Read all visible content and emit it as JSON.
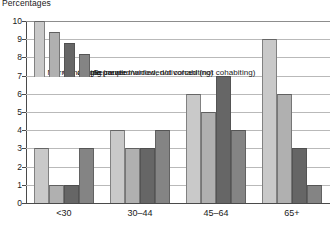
{
  "chart_data": {
    "type": "bar",
    "title": "Percentages",
    "xlabel": "",
    "ylabel": "",
    "ylim": [
      0,
      10
    ],
    "ytick_values": [
      0,
      1,
      2,
      3,
      4,
      5,
      6,
      7,
      8,
      9,
      10
    ],
    "ytick_labels": [
      "0",
      "1",
      "2",
      "3",
      "4",
      "5",
      "6",
      "7",
      "8",
      "9",
      "10"
    ],
    "grid": true,
    "legend_position": "upper-left-overlay",
    "categories": [
      "<30",
      "30–44",
      "45–64",
      "65+"
    ],
    "series": [
      {
        "name": "Married couple",
        "color": "#c9c9c9",
        "values": [
          3,
          4,
          6,
          9
        ]
      },
      {
        "name": "Cohabiting couple",
        "color": "#b0b0b0",
        "values": [
          1,
          3,
          5,
          6
        ]
      },
      {
        "name": "Single (never married, not cohabiting)",
        "color": "#666666",
        "values": [
          1,
          3,
          7,
          3
        ]
      },
      {
        "name": "Separated/widowed/divorced (not cohabiting)",
        "color": "#848484",
        "values": [
          3,
          4,
          4,
          1
        ]
      }
    ]
  },
  "colors": {
    "axis": "#4a4a4a",
    "grid": "#b9b9b9",
    "text": "#1a1a1a",
    "background": "#ffffff"
  }
}
